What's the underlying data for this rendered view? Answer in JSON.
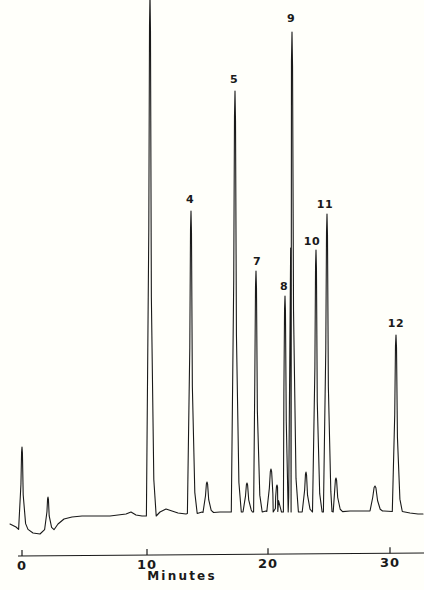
{
  "chart_data": {
    "type": "line",
    "title": "",
    "subtitle": "",
    "xlabel": "Minutes",
    "ylabel": "",
    "xlim": [
      0,
      31.9
    ],
    "ylim": [
      0,
      1
    ],
    "grid": false,
    "legend": null,
    "x_ticks": [
      {
        "value": 0,
        "label": "0",
        "px": 22
      },
      {
        "value": 10,
        "label": "10",
        "px": 147
      },
      {
        "value": 20,
        "label": "20",
        "px": 268
      },
      {
        "value": 30,
        "label": "30",
        "px": 390
      }
    ],
    "annotations": [
      {
        "label": "4",
        "x_minutes": 13.7,
        "label_px_x": 190,
        "label_px_y": 194
      },
      {
        "label": "5",
        "x_minutes": 17.3,
        "label_px_x": 234,
        "label_px_y": 74
      },
      {
        "label": "7",
        "x_minutes": 19.0,
        "label_px_x": 257,
        "label_px_y": 256
      },
      {
        "label": "8",
        "x_minutes": 21.4,
        "label_px_x": 284,
        "label_px_y": 281
      },
      {
        "label": "9",
        "x_minutes": 21.9,
        "label_px_x": 291,
        "label_px_y": 13
      },
      {
        "label": "10",
        "x_minutes": 23.8,
        "label_px_x": 312,
        "label_px_y": 236
      },
      {
        "label": "11",
        "x_minutes": 24.7,
        "label_px_x": 325,
        "label_px_y": 199
      },
      {
        "label": "12",
        "x_minutes": 30.4,
        "label_px_x": 396,
        "label_px_y": 318
      }
    ],
    "baseline_px_y": 513,
    "axis_px_y": 556,
    "peaks": [
      {
        "id": "injection-spike",
        "px_x": 22,
        "top_px_y": 447,
        "half_width_px": 1.4,
        "label": null
      },
      {
        "id": "small-spike-1",
        "px_x": 48,
        "top_px_y": 497,
        "half_width_px": 1.4,
        "label": null
      },
      {
        "id": "solvent-peak",
        "px_x": 150,
        "top_px_y": -6,
        "half_width_px": 1.6,
        "label": null
      },
      {
        "id": "peak-4",
        "px_x": 191,
        "top_px_y": 211,
        "half_width_px": 1.6,
        "label": "4"
      },
      {
        "id": "minor-a",
        "px_x": 207,
        "top_px_y": 482,
        "half_width_px": 2.0,
        "label": null
      },
      {
        "id": "peak-5",
        "px_x": 235,
        "top_px_y": 91,
        "half_width_px": 1.7,
        "label": "5"
      },
      {
        "id": "minor-b",
        "px_x": 247,
        "top_px_y": 483,
        "half_width_px": 2.0,
        "label": null
      },
      {
        "id": "peak-7",
        "px_x": 256,
        "top_px_y": 271,
        "half_width_px": 1.6,
        "label": "7"
      },
      {
        "id": "minor-c",
        "px_x": 271,
        "top_px_y": 469,
        "half_width_px": 2.2,
        "label": null
      },
      {
        "id": "minor-d",
        "px_x": 277,
        "top_px_y": 485,
        "half_width_px": 1.8,
        "label": null
      },
      {
        "id": "peak-8",
        "px_x": 285,
        "top_px_y": 296,
        "half_width_px": 1.5,
        "label": "8"
      },
      {
        "id": "peak-9",
        "px_x": 292,
        "top_px_y": 32,
        "half_width_px": 1.8,
        "label": "9"
      },
      {
        "id": "minor-e",
        "px_x": 306,
        "top_px_y": 472,
        "half_width_px": 1.8,
        "label": null
      },
      {
        "id": "peak-10",
        "px_x": 316,
        "top_px_y": 250,
        "half_width_px": 1.5,
        "label": "10"
      },
      {
        "id": "peak-11",
        "px_x": 327,
        "top_px_y": 214,
        "half_width_px": 1.6,
        "label": "11"
      },
      {
        "id": "minor-f",
        "px_x": 336,
        "top_px_y": 478,
        "half_width_px": 2.0,
        "label": null
      },
      {
        "id": "minor-g",
        "px_x": 375,
        "top_px_y": 486,
        "half_width_px": 3.0,
        "label": null
      },
      {
        "id": "peak-12",
        "px_x": 396,
        "top_px_y": 335,
        "half_width_px": 1.7,
        "label": "12"
      }
    ],
    "trace_color": "#1a1a1a",
    "background_color": "#fffffa"
  },
  "axis": {
    "title": "Minutes",
    "title_px_x": 182,
    "title_px_y": 570,
    "tick_label_px_y": 559
  }
}
